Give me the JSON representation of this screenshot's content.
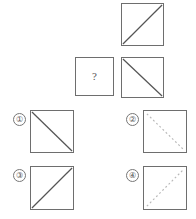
{
  "puzzle": {
    "type": "visual-analogy-matrix",
    "prompt_symbol": "?",
    "stroke_color": "#6e6e6e",
    "diagonal_solid_color": "#555555",
    "diagonal_dashed_color": "#b8b8b8",
    "background": "#ffffff"
  },
  "matrix": {
    "cells": [
      {
        "id": "cell-top-right",
        "name": "top-square",
        "diagonal": "bottom-left-to-top-right",
        "line_style": "solid"
      },
      {
        "id": "cell-mid-left",
        "name": "question-square",
        "diagonal": "none",
        "line_style": "none",
        "label": "?"
      },
      {
        "id": "cell-mid-right",
        "name": "middle-square",
        "diagonal": "top-left-to-bottom-right",
        "line_style": "solid"
      }
    ]
  },
  "options": [
    {
      "number": "①",
      "name": "option-1",
      "diagonal": "top-left-to-bottom-right",
      "line_style": "solid"
    },
    {
      "number": "②",
      "name": "option-2",
      "diagonal": "top-left-to-bottom-right",
      "line_style": "dashed"
    },
    {
      "number": "③",
      "name": "option-3",
      "diagonal": "bottom-left-to-top-right",
      "line_style": "solid"
    },
    {
      "number": "④",
      "name": "option-4",
      "diagonal": "bottom-left-to-top-right",
      "line_style": "dashed"
    }
  ]
}
